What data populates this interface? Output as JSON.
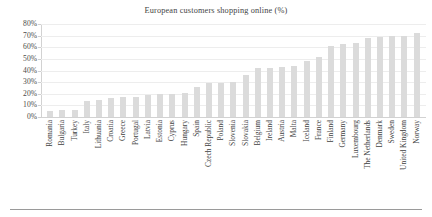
{
  "chart_data": {
    "type": "bar",
    "title": "European customers shopping online (%)",
    "xlabel": "",
    "ylabel": "",
    "ylim": [
      0,
      80
    ],
    "ytick_labels": [
      "80%",
      "70%",
      "60%",
      "50%",
      "40%",
      "30%",
      "20%",
      "10%",
      "0%"
    ],
    "ytick_values": [
      80,
      70,
      60,
      50,
      40,
      30,
      20,
      10,
      0
    ],
    "grid": true,
    "legend": "none",
    "bar_color": "#dbdbdb",
    "categories": [
      "Romania",
      "Bulgaria",
      "Turkey",
      "Italy",
      "Lithuania",
      "Croatia",
      "Greece",
      "Portugal",
      "Latvia",
      "Estonia",
      "Cyprus",
      "Hungary",
      "Spain",
      "Czech Republic",
      "Poland",
      "Slovenia",
      "Slovakia",
      "Belgium",
      "Ireland",
      "Austria",
      "Malta",
      "Iceland",
      "France",
      "Finland",
      "Germany",
      "Luxembourg",
      "The Netherlands",
      "Denmark",
      "Sweden",
      "United Kingdom",
      "Norway"
    ],
    "values": [
      5,
      6,
      6,
      14,
      15,
      16,
      17,
      17,
      19,
      20,
      20,
      21,
      26,
      29,
      29,
      30,
      36,
      42,
      42,
      43,
      44,
      48,
      52,
      61,
      63,
      64,
      68,
      69,
      70,
      70,
      72
    ]
  }
}
